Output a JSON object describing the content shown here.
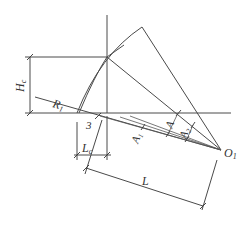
{
  "diagram": {
    "type": "geometric-construction",
    "labels": {
      "Hc": {
        "main": "H",
        "sub": "c"
      },
      "R1": {
        "main": "R",
        "sub": "1"
      },
      "three": {
        "main": "3",
        "sub": ""
      },
      "Lc": {
        "main": "L",
        "sub": "c"
      },
      "A1": {
        "main": "A",
        "sub": "1"
      },
      "A": {
        "main": "A",
        "sub": ""
      },
      "A2": {
        "main": "A",
        "sub": "2"
      },
      "O1": {
        "main": "O",
        "sub": "1"
      },
      "L": {
        "main": "L",
        "sub": ""
      }
    },
    "stroke_color": "#4a4a4a",
    "text_color": "#333333",
    "background": "#ffffff"
  }
}
